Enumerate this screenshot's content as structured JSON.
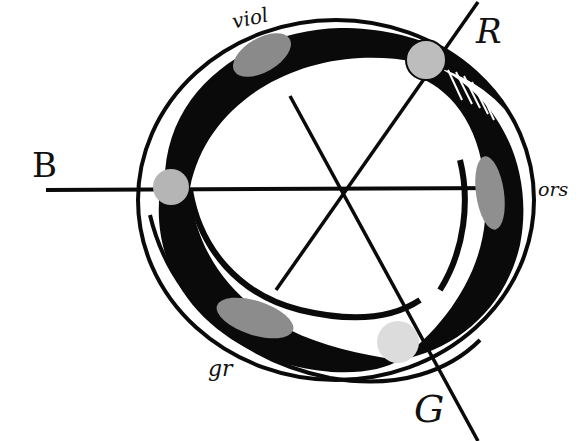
{
  "diagram": {
    "type": "color-circle-ring-diagram",
    "colors": {
      "ink": "#0a0a0a",
      "paper": "#ffffff",
      "blob_grey": "#8a8a8a",
      "dot_grey": "#bdbdbd",
      "dot_light": "#dcdcdc"
    },
    "labels": {
      "viol": "viol",
      "R": "R",
      "ors": "ors",
      "B": "B",
      "gr": "gr",
      "G": "G"
    },
    "axes": [
      {
        "name": "B-axis",
        "from": "B",
        "direction": "horizontal"
      },
      {
        "name": "R-axis",
        "from": "center",
        "to": "R",
        "direction": "upper-right"
      },
      {
        "name": "G-axis",
        "from": "center",
        "to": "G",
        "direction": "lower-right"
      }
    ],
    "primary_points": [
      {
        "name": "R",
        "position": "top-right"
      },
      {
        "name": "B",
        "position": "left"
      },
      {
        "name": "G",
        "position": "bottom-right"
      }
    ],
    "intermediate_blobs": [
      {
        "name": "viol",
        "position": "top-left"
      },
      {
        "name": "ors",
        "position": "right"
      },
      {
        "name": "gr",
        "position": "bottom-left"
      }
    ]
  }
}
